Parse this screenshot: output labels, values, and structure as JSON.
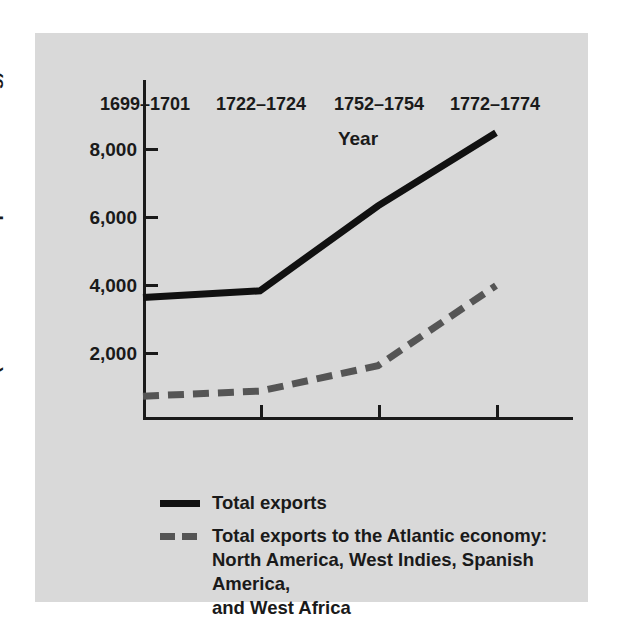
{
  "chart_data": {
    "type": "line",
    "title": "",
    "xlabel": "Year",
    "ylabel": "Value (in thousands of pounds sterling)",
    "categories": [
      "1699–1701",
      "1722–1724",
      "1752–1754",
      "1772–1774"
    ],
    "ylim": [
      0,
      10000
    ],
    "yticks": [
      2000,
      4000,
      6000,
      8000
    ],
    "ytick_labels": [
      "2,000",
      "4,000",
      "6,000",
      "8,000"
    ],
    "grid": false,
    "legend_position": "below-plot",
    "series": [
      {
        "name": "Total exports",
        "style": "solid",
        "color": "#111111",
        "values": [
          3600,
          3800,
          6300,
          8450
        ]
      },
      {
        "name": "Total exports to the Atlantic economy: North America, West Indies, Spanish America, and West Africa",
        "style": "dashed",
        "color": "#555555",
        "values": [
          700,
          850,
          1600,
          3950
        ]
      }
    ]
  },
  "axes": {
    "y_title": "Value (in thousands of pounds sterling)",
    "x_title": "Year",
    "y_tick_labels": [
      "8,000",
      "6,000",
      "4,000",
      "2,000"
    ],
    "x_tick_labels": [
      "1699–1701",
      "1722–1724",
      "1752–1754",
      "1772–1774"
    ]
  },
  "legend": {
    "items": [
      {
        "swatch": "solid-line-swatch",
        "label": "Total exports"
      },
      {
        "swatch": "dashed-line-swatch",
        "label": "Total exports to the Atlantic economy:\nNorth America, West Indies, Spanish America,\nand West Africa"
      }
    ]
  },
  "colors": {
    "panel_background": "#d9d9d9",
    "page_background": "#ffffff",
    "ink": "#1a1a1a",
    "series_solid": "#111111",
    "series_dashed": "#555555"
  }
}
